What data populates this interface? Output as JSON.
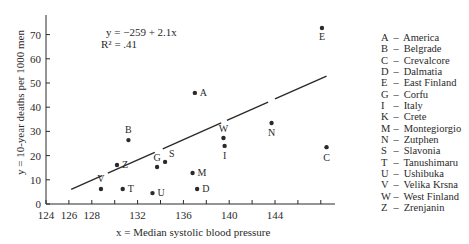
{
  "chart_data": {
    "type": "scatter",
    "title": "",
    "xlabel": "x = Median systolic blood pressure",
    "ylabel": "y = 10-year deaths per 1000 men",
    "xlim": [
      124,
      148
    ],
    "ylim": [
      0,
      75
    ],
    "x_ticks": [
      124,
      126,
      128,
      132,
      136,
      140,
      144
    ],
    "x_minor_ticks": [
      130,
      134,
      138,
      142,
      146,
      148
    ],
    "y_ticks": [
      0,
      10,
      20,
      30,
      40,
      50,
      60,
      70
    ],
    "grid": false,
    "legend_position": "right",
    "regression": {
      "equation": "y = −259 + 2.1x",
      "r_squared": "R² = .41",
      "intercept": -259,
      "slope": 2.1,
      "x_start": 126.2,
      "x_end": 148.5
    },
    "points": [
      {
        "key": "A",
        "x": 137.0,
        "y": 45.9
      },
      {
        "key": "B",
        "x": 131.2,
        "y": 26.4
      },
      {
        "key": "C",
        "x": 148.5,
        "y": 23.5
      },
      {
        "key": "D",
        "x": 137.2,
        "y": 6.2
      },
      {
        "key": "E",
        "x": 148.1,
        "y": 72.7
      },
      {
        "key": "G",
        "x": 133.7,
        "y": 15.3
      },
      {
        "key": "I",
        "x": 139.6,
        "y": 24.0
      },
      {
        "key": "M",
        "x": 136.8,
        "y": 12.8
      },
      {
        "key": "N",
        "x": 143.7,
        "y": 33.5
      },
      {
        "key": "S",
        "x": 134.4,
        "y": 17.4
      },
      {
        "key": "T",
        "x": 130.7,
        "y": 6.2
      },
      {
        "key": "U",
        "x": 133.3,
        "y": 4.5
      },
      {
        "key": "V",
        "x": 128.8,
        "y": 6.2
      },
      {
        "key": "W",
        "x": 139.5,
        "y": 27.3
      },
      {
        "key": "Z",
        "x": 130.2,
        "y": 16.1
      }
    ],
    "legend": [
      {
        "key": "A",
        "name": "America"
      },
      {
        "key": "B",
        "name": "Belgrade"
      },
      {
        "key": "C",
        "name": "Crevalcore"
      },
      {
        "key": "D",
        "name": "Dalmatia"
      },
      {
        "key": "E",
        "name": "East Finland"
      },
      {
        "key": "G",
        "name": "Corfu"
      },
      {
        "key": "I",
        "name": "Italy"
      },
      {
        "key": "K",
        "name": "Crete"
      },
      {
        "key": "M",
        "name": "Montegiorgio"
      },
      {
        "key": "N",
        "name": "Zutphen"
      },
      {
        "key": "S",
        "name": "Slavonia"
      },
      {
        "key": "T",
        "name": "Tanushimaru"
      },
      {
        "key": "U",
        "name": "Ushibuka"
      },
      {
        "key": "V",
        "name": "Velika Krsna"
      },
      {
        "key": "W",
        "name": "West Finland"
      },
      {
        "key": "Z",
        "name": "Zrenjanin"
      }
    ]
  },
  "labels": {
    "equation": "y = −259 + 2.1x",
    "r_squared": "R² = .41",
    "xlabel": "x = Median systolic blood pressure",
    "ylabel": "y = 10-year deaths per 1000 men",
    "dash": "–"
  },
  "colors": {
    "ink": "#2a2a2a",
    "background": "#ffffff"
  }
}
